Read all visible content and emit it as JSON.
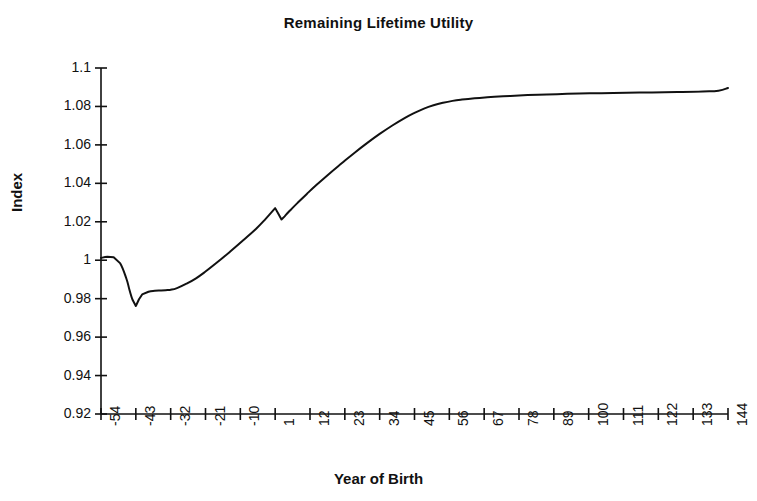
{
  "chart_data": {
    "type": "line",
    "title": "Remaining Lifetime Utility",
    "xlabel": "Year of Birth",
    "ylabel": "Index",
    "ylim": [
      0.92,
      1.1
    ],
    "ytick_step": 0.02,
    "yticks": [
      "0.92",
      "0.94",
      "0.96",
      "0.98",
      "1",
      "1.02",
      "1.04",
      "1.06",
      "1.08",
      "1.1"
    ],
    "xlim": [
      -54,
      144
    ],
    "xtick_step": 11,
    "xticks": [
      "-54",
      "-43",
      "-32",
      "-21",
      "-10",
      "1",
      "12",
      "23",
      "34",
      "45",
      "56",
      "67",
      "78",
      "89",
      "100",
      "111",
      "122",
      "133",
      "144"
    ],
    "grid": false,
    "legend": "none",
    "line_color": "#111111",
    "line_width": 2,
    "series": [
      {
        "name": "Remaining Lifetime Utility",
        "x": [
          -54,
          -52,
          -50,
          -48,
          -46,
          -45,
          -44,
          -43,
          -42,
          -41,
          -39,
          -37,
          -35,
          -33,
          -32,
          -30,
          -27,
          -24,
          -21,
          -17,
          -13,
          -9,
          -5,
          -2,
          1,
          2,
          3,
          4,
          5,
          6,
          8,
          11,
          14,
          18,
          22,
          26,
          30,
          34,
          38,
          42,
          45,
          48,
          51,
          54,
          57,
          60,
          64,
          68,
          73,
          78,
          84,
          90,
          97,
          104,
          112,
          120,
          128,
          136,
          141,
          144
        ],
        "y": [
          1.0012,
          1.0018,
          1.0016,
          0.9985,
          0.9905,
          0.9845,
          0.9793,
          0.9762,
          0.9797,
          0.9822,
          0.9836,
          0.9841,
          0.9843,
          0.9845,
          0.9846,
          0.9855,
          0.9878,
          0.9906,
          0.9941,
          0.9993,
          1.0048,
          1.0105,
          1.0164,
          1.0215,
          1.0271,
          1.0242,
          1.0212,
          1.0228,
          1.0247,
          1.0264,
          1.0297,
          1.0345,
          1.0391,
          1.0449,
          1.0504,
          1.0558,
          1.0609,
          1.0657,
          1.0701,
          1.0741,
          1.0767,
          1.0789,
          1.0806,
          1.0819,
          1.0829,
          1.0836,
          1.0843,
          1.0848,
          1.0853,
          1.0857,
          1.0861,
          1.0864,
          1.0867,
          1.0869,
          1.0871,
          1.0873,
          1.0875,
          1.0878,
          1.0882,
          1.0896
        ]
      }
    ]
  },
  "axes_geometry": {
    "left": 101,
    "right": 728,
    "top": 68,
    "bottom": 414
  }
}
